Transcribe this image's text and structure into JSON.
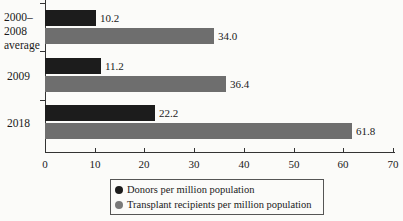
{
  "chart_data": {
    "type": "bar",
    "orientation": "horizontal",
    "title": "",
    "xlabel": "",
    "ylabel": "",
    "categories": [
      "2000–2008 average",
      "2009",
      "2018"
    ],
    "category_lines": [
      [
        "2000–",
        "2008",
        "average"
      ],
      [
        "2009"
      ],
      [
        "2018"
      ]
    ],
    "series": [
      {
        "name": "Donors per million population",
        "color": "#1c1c1c",
        "values": [
          10.2,
          11.2,
          22.2
        ]
      },
      {
        "name": "Transplant recipients per million population",
        "color": "#6e6e6e",
        "values": [
          34.0,
          36.4,
          61.8
        ]
      }
    ],
    "value_labels": [
      [
        "10.2",
        "11.2",
        "22.2"
      ],
      [
        "34.0",
        "36.4",
        "61.8"
      ]
    ],
    "xlim": [
      0,
      70
    ],
    "xticks": [
      "0",
      "10",
      "20",
      "30",
      "40",
      "50",
      "60",
      "70"
    ],
    "grid": false,
    "legend_position": "bottom"
  },
  "legend": {
    "items": [
      {
        "label": "Donors per million population",
        "color": "#1c1c1c"
      },
      {
        "label": "Transplant recipients per million population",
        "color": "#6e6e6e"
      }
    ]
  }
}
